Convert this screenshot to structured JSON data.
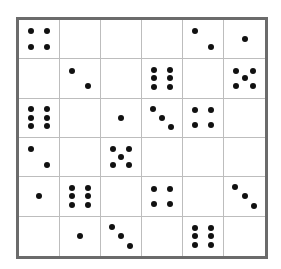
{
  "puzzle": {
    "rows": 6,
    "cols": 6,
    "pip_color": "#111111",
    "border_color": "#6b6b6b",
    "grid_line_color": "#bdbdbd",
    "cells": [
      [
        4,
        0,
        0,
        0,
        2,
        1
      ],
      [
        0,
        2,
        0,
        6,
        0,
        5
      ],
      [
        6,
        0,
        1,
        3,
        4,
        0
      ],
      [
        2,
        0,
        5,
        0,
        0,
        0
      ],
      [
        1,
        6,
        0,
        4,
        0,
        3
      ],
      [
        0,
        1,
        3,
        0,
        6,
        0
      ]
    ]
  }
}
